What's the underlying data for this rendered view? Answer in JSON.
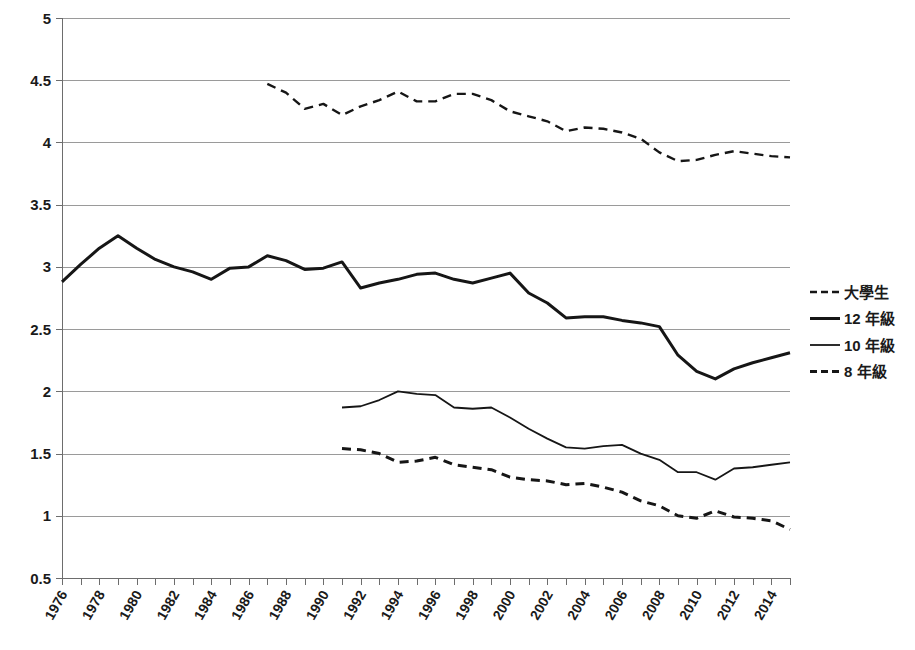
{
  "chart_data": {
    "type": "line",
    "title": "",
    "xlabel": "",
    "ylabel": "",
    "ylim": [
      0.5,
      5
    ],
    "ytick_step": 0.5,
    "yticks": [
      "5",
      "4.5",
      "4",
      "3.5",
      "3",
      "2.5",
      "2",
      "1.5",
      "1",
      "0.5"
    ],
    "xlim": [
      1976,
      2015
    ],
    "xticks": [
      "1976",
      "1978",
      "1980",
      "1982",
      "1984",
      "1986",
      "1988",
      "1990",
      "1992",
      "1994",
      "1996",
      "1998",
      "2000",
      "2002",
      "2004",
      "2006",
      "2008",
      "2010",
      "2012",
      "2014"
    ],
    "xtick_step": 2,
    "minor_xtick_step": 1,
    "grid": "horizontal",
    "legend_position": "right",
    "series": [
      {
        "name": "大學生",
        "style": "dashed",
        "stroke_width": 2.4,
        "dash": "9,6",
        "color": "#161616",
        "x": [
          1987,
          1988,
          1989,
          1990,
          1991,
          1992,
          1993,
          1994,
          1995,
          1996,
          1997,
          1998,
          1999,
          2000,
          2001,
          2002,
          2003,
          2004,
          2005,
          2006,
          2007,
          2008,
          2009,
          2010,
          2011,
          2012,
          2013,
          2014,
          2015
        ],
        "values": [
          4.47,
          4.4,
          4.27,
          4.31,
          4.22,
          4.29,
          4.34,
          4.41,
          4.33,
          4.33,
          4.39,
          4.39,
          4.34,
          4.25,
          4.21,
          4.17,
          4.09,
          4.12,
          4.11,
          4.08,
          4.03,
          3.92,
          3.85,
          3.86,
          3.9,
          3.93,
          3.91,
          3.89,
          3.88
        ]
      },
      {
        "name": "12 年級",
        "style": "solid",
        "stroke_width": 3.0,
        "dash": "",
        "color": "#161616",
        "x": [
          1976,
          1977,
          1978,
          1979,
          1980,
          1981,
          1982,
          1983,
          1984,
          1985,
          1986,
          1987,
          1988,
          1989,
          1990,
          1991,
          1992,
          1993,
          1994,
          1995,
          1996,
          1997,
          1998,
          1999,
          2000,
          2001,
          2002,
          2003,
          2004,
          2005,
          2006,
          2007,
          2008,
          2009,
          2010,
          2011,
          2012,
          2013,
          2014,
          2015
        ],
        "values": [
          2.88,
          3.02,
          3.15,
          3.25,
          3.15,
          3.06,
          3.0,
          2.96,
          2.9,
          2.99,
          3.0,
          3.09,
          3.05,
          2.98,
          2.99,
          3.04,
          2.83,
          2.87,
          2.9,
          2.94,
          2.95,
          2.9,
          2.87,
          2.91,
          2.95,
          2.79,
          2.71,
          2.59,
          2.6,
          2.6,
          2.57,
          2.55,
          2.52,
          2.29,
          2.16,
          2.1,
          2.18,
          2.23,
          2.27,
          2.31
        ]
      },
      {
        "name": "10 年級",
        "style": "solid",
        "stroke_width": 1.8,
        "dash": "",
        "color": "#161616",
        "x": [
          1991,
          1992,
          1993,
          1994,
          1995,
          1996,
          1997,
          1998,
          1999,
          2000,
          2001,
          2002,
          2003,
          2004,
          2005,
          2006,
          2007,
          2008,
          2009,
          2010,
          2011,
          2012,
          2013,
          2014,
          2015
        ],
        "values": [
          1.87,
          1.88,
          1.93,
          2.0,
          1.98,
          1.97,
          1.87,
          1.86,
          1.87,
          1.79,
          1.7,
          1.62,
          1.55,
          1.54,
          1.56,
          1.57,
          1.5,
          1.45,
          1.35,
          1.35,
          1.29,
          1.38,
          1.39,
          1.41,
          1.43
        ]
      },
      {
        "name": "8 年級",
        "style": "dashed",
        "stroke_width": 3.0,
        "dash": "9,6",
        "color": "#161616",
        "x": [
          1991,
          1992,
          1993,
          1994,
          1995,
          1996,
          1997,
          1998,
          1999,
          2000,
          2001,
          2002,
          2003,
          2004,
          2005,
          2006,
          2007,
          2008,
          2009,
          2010,
          2011,
          2012,
          2013,
          2014,
          2015
        ],
        "values": [
          1.54,
          1.53,
          1.5,
          1.43,
          1.44,
          1.47,
          1.41,
          1.39,
          1.37,
          1.31,
          1.29,
          1.28,
          1.25,
          1.26,
          1.23,
          1.19,
          1.12,
          1.08,
          1.0,
          0.98,
          1.04,
          0.99,
          0.98,
          0.96,
          0.89
        ]
      }
    ]
  }
}
